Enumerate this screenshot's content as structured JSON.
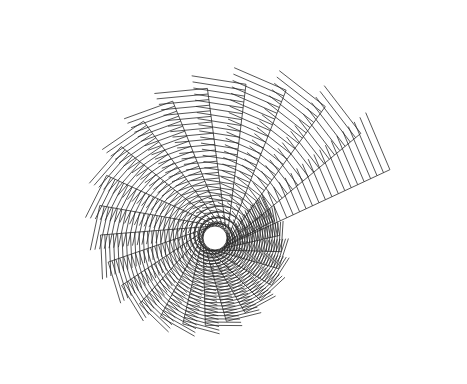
{
  "figure": {
    "background": "#ffffff",
    "stroke": "#2a2a2a",
    "center": [
      215,
      238
    ],
    "hole_radius": 12,
    "arms": 26,
    "start_angle_deg": -25,
    "angle_step_deg": -14.5,
    "start_length": 185,
    "length_decay": 0.955,
    "hatch_count": 26,
    "start_hatch_len": 62,
    "hatch_decay": 0.97,
    "hatch_skew_deg": 88
  }
}
